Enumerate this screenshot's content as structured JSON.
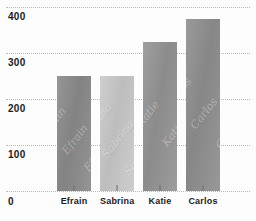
{
  "chart_data": {
    "type": "bar",
    "title": "",
    "subtitle": "",
    "xlabel": "",
    "ylabel": "",
    "categories": [
      "Efrain",
      "Sabrina",
      "Katie",
      "Carlos"
    ],
    "values": [
      250,
      250,
      325,
      375
    ],
    "data_labels": [
      "250",
      "250",
      "325",
      "375"
    ],
    "ylim": [
      0,
      400
    ],
    "yticks": [
      400,
      300,
      200,
      100,
      0
    ],
    "ytick_labels": [
      "400",
      "300",
      "200",
      "100",
      "0"
    ],
    "grid": true,
    "grid_style": "dotted",
    "legend": "none",
    "bar_watermarks": [
      "Efrain",
      "Sabrina",
      "Katie",
      "Carlos"
    ],
    "bar_colors": [
      "#8b8b8b",
      "#c9c9c9",
      "#949494",
      "#8f8f8f"
    ],
    "background_color": "#fdfdfd",
    "grid_color": "#b9b9b9",
    "text_color": "#1b1b1b"
  }
}
